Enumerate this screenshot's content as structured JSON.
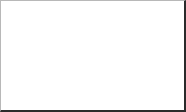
{
  "figure": {
    "kind": "normal-distribution-diagram",
    "border_color": "#2b2b2b",
    "background_color": "#ffffff"
  },
  "labels": {
    "origin": "0",
    "z_threshold": "z",
    "z_threshold_subscript": "1",
    "x_axis": "z"
  },
  "colors": {
    "curve": "#8a8a8a",
    "fill": "#e2e2e2",
    "axis": "#7d7d7d",
    "vertical_axis": "#6e6e6e",
    "z_line": "#8a8a8a",
    "text": "#1b1b1b"
  },
  "chart_data": {
    "type": "area",
    "title": "",
    "xlabel": "z",
    "ylabel": "",
    "xlim": [
      -4.0,
      4.0
    ],
    "ylim": [
      0,
      0.45
    ],
    "grid": false,
    "legend": null,
    "distribution": {
      "name": "standard normal",
      "mean": 0,
      "sd": 1,
      "pdf": "f(z) = (1/sqrt(2*pi)) * exp(-z^2/2)"
    },
    "annotations": [
      {
        "name": "origin-tick-label",
        "text": "0",
        "x": 0,
        "y": 0
      },
      {
        "name": "z1-tick-label",
        "text": "z1",
        "x": 1.22,
        "y": 0
      },
      {
        "name": "axis-label",
        "text": "z",
        "x": 3.85,
        "y": 0
      }
    ],
    "shaded_region": {
      "from": -4.0,
      "to": 1.22,
      "label": "area to the left of z1",
      "fill": "#e2e2e2"
    },
    "markers": [
      {
        "name": "z1-vertical-line",
        "x": 1.22,
        "y_from": 0,
        "y_to": 0.1895
      }
    ],
    "x": [
      -4.0,
      -3.75,
      -3.5,
      -3.25,
      -3.0,
      -2.75,
      -2.5,
      -2.25,
      -2.0,
      -1.75,
      -1.5,
      -1.25,
      -1.0,
      -0.75,
      -0.5,
      -0.25,
      0.0,
      0.25,
      0.5,
      0.75,
      1.0,
      1.22,
      1.25,
      1.5,
      1.75,
      2.0,
      2.25,
      2.5,
      2.75,
      3.0,
      3.25,
      3.5,
      3.75,
      4.0
    ],
    "y": [
      0.0001,
      0.0004,
      0.0009,
      0.002,
      0.0044,
      0.0091,
      0.0175,
      0.0317,
      0.054,
      0.0863,
      0.1295,
      0.1826,
      0.242,
      0.3011,
      0.3521,
      0.3867,
      0.3989,
      0.3867,
      0.3521,
      0.3011,
      0.242,
      0.1895,
      0.1826,
      0.1295,
      0.0863,
      0.054,
      0.0317,
      0.0175,
      0.0091,
      0.0044,
      0.002,
      0.0009,
      0.0004,
      0.0001
    ]
  }
}
